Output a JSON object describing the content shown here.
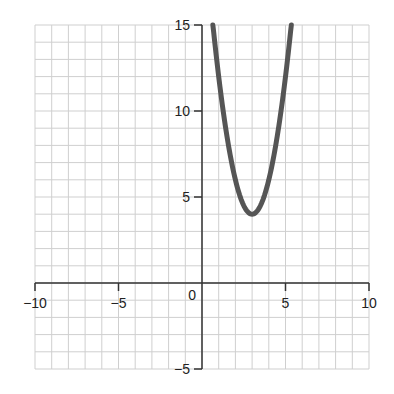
{
  "chart_data": {
    "type": "line",
    "title": "",
    "xlabel": "",
    "ylabel": "",
    "xlim": [
      -10,
      10
    ],
    "ylim": [
      -5,
      15
    ],
    "grid": true,
    "grid_step": 1,
    "x_ticks": [
      -10,
      -5,
      0,
      5,
      10
    ],
    "x_tick_labels": [
      "−10",
      "−5",
      "0",
      "5",
      "10"
    ],
    "y_ticks": [
      -5,
      5,
      10,
      15
    ],
    "y_tick_labels": [
      "−5",
      "5",
      "10",
      "15"
    ],
    "series": [
      {
        "name": "y = 2(x - 3)^2 + 4",
        "equation": "y = 2x^2 - 12x + 22",
        "vertex": [
          3,
          4
        ],
        "x": [
          0.65,
          1,
          1.5,
          2,
          2.5,
          3,
          3.5,
          4,
          4.5,
          5,
          5.35
        ],
        "y": [
          15.05,
          12,
          8.5,
          6,
          4.5,
          4,
          4.5,
          6,
          8.5,
          12,
          15.05
        ],
        "color": "#555555"
      }
    ]
  },
  "colors": {
    "grid": "#cfcfcf",
    "axis": "#333333",
    "curve": "#555555"
  }
}
